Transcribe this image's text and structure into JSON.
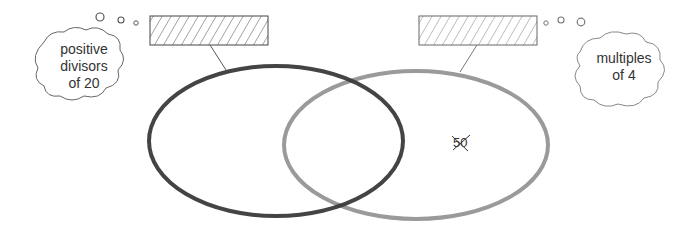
{
  "diagram": {
    "type": "venn",
    "sets": [
      {
        "id": "left",
        "label": "positive divisors of 20",
        "label_lines": [
          "positive",
          "divisors",
          "of 20"
        ],
        "stroke_color": "#3a3a3a",
        "label_box": "hatched blank box"
      },
      {
        "id": "right",
        "label": "multiples of 4",
        "label_lines": [
          "multiples",
          "of 4"
        ],
        "stroke_color": "#9a9a9a",
        "label_box": "hatched blank box"
      }
    ],
    "elements": [
      {
        "value": "50",
        "region": "right-only",
        "struck_out": true
      }
    ]
  }
}
